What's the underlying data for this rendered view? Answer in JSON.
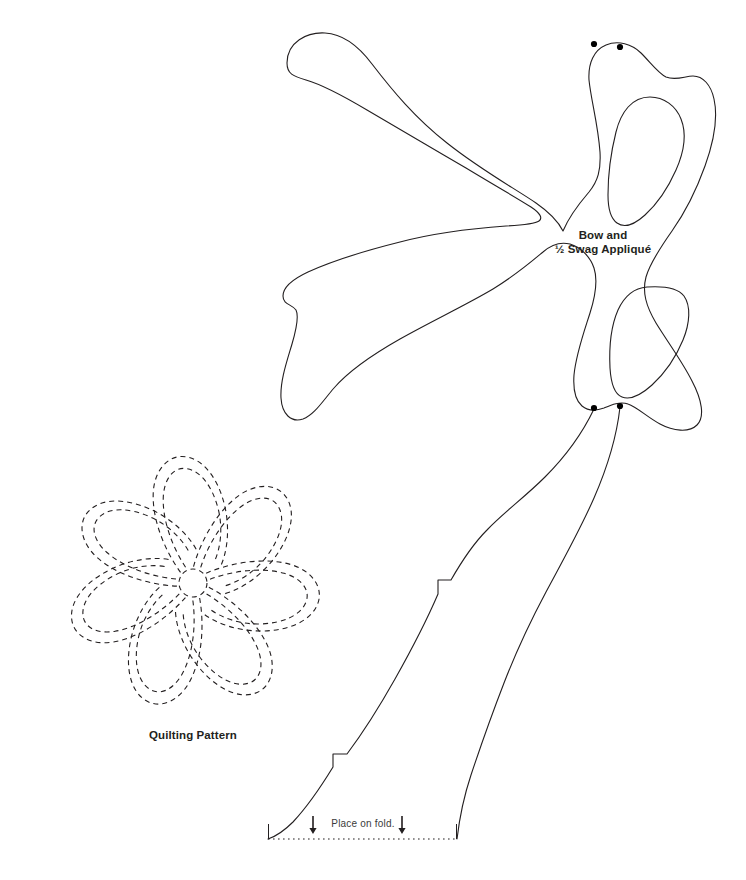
{
  "page": {
    "background_color": "#ffffff",
    "ink_color": "#231f20",
    "width": 746,
    "height": 880
  },
  "labels": {
    "bow_line1": "Bow and",
    "bow_line2": "½ Swag Appliqué",
    "quilting": "Quilting Pattern",
    "place_on_fold": "Place on fold."
  },
  "template_pieces": [
    {
      "name": "bow-and-half-swag-applique",
      "line_style": "solid",
      "stroke_color": "#231f20",
      "stroke_width": 1.1,
      "registration_dots": 4,
      "loops": 2,
      "tails": 2
    },
    {
      "name": "flower-quilting-pattern",
      "line_style": "dashed",
      "stroke_color": "#231f20",
      "stroke_width": 1.1,
      "dash_pattern": "5 4",
      "petals": 7,
      "outlines_per_petal": 2,
      "center_circle_radius": 14
    },
    {
      "name": "fold-baseline",
      "line_style": "dotted",
      "stroke_color": "#231f20",
      "x_start": 268,
      "x_end": 457,
      "y": 839
    }
  ],
  "markers": {
    "dot_color": "#000000",
    "dot_radius": 3.1,
    "top_dots": [
      [
        594,
        44
      ],
      [
        620,
        47
      ]
    ],
    "bottom_dots": [
      [
        594,
        408
      ],
      [
        620,
        406
      ]
    ],
    "fold_arrows": [
      [
        313,
        822
      ],
      [
        402,
        822
      ]
    ]
  }
}
